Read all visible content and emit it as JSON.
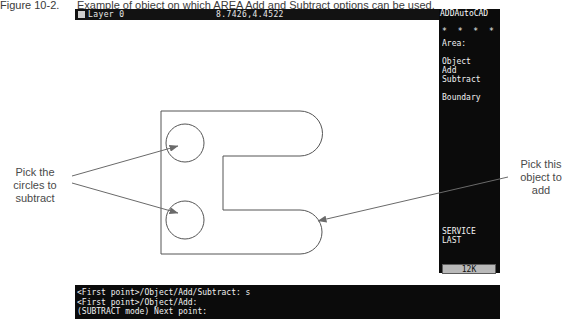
{
  "caption": {
    "number": "Figure 10-2.",
    "text": "Example of object on which AREA Add and Subtract options can be used."
  },
  "statusbar": {
    "layer": "Layer 0",
    "coordinates": "8.7426,4.4522"
  },
  "sidemenu": {
    "title": "ADDAutoCAD",
    "stars": "* * * *",
    "items": [
      {
        "label": "Area:",
        "top": 8
      },
      {
        "label": "Object",
        "top": 26
      },
      {
        "label": "Add",
        "top": 35
      },
      {
        "label": "Subtract",
        "top": 44
      },
      {
        "label": "Boundary",
        "top": 62
      },
      {
        "label": "SERVICE",
        "top": 208
      },
      {
        "label": "LAST",
        "top": 217
      }
    ],
    "memory_indicator": "12K"
  },
  "command": {
    "lines": [
      "<First point>/Object/Add/Subtract: s",
      "<First point>/Object/Add:",
      "(SUBTRACT mode) Next point:"
    ]
  },
  "annotations": {
    "left": "Pick the circles to subtract",
    "right": "Pick this object to add"
  },
  "drawing": {
    "description": "C-shaped bracket outline with two circles",
    "stroke_color": "#555555"
  }
}
